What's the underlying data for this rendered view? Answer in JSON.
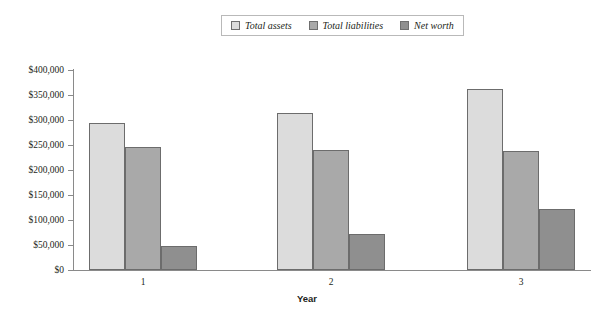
{
  "chart_data": {
    "type": "bar",
    "title": "",
    "subtitle": "",
    "xlabel": "Year",
    "ylabel": "",
    "categories": [
      "1",
      "2",
      "3"
    ],
    "series": [
      {
        "name": "Total assets",
        "values": [
          295000,
          315000,
          363000
        ],
        "color": "#dcdcdc"
      },
      {
        "name": "Total liabilities",
        "values": [
          246000,
          241000,
          239000
        ],
        "color": "#a9a9a9"
      },
      {
        "name": "Net worth",
        "values": [
          49000,
          73000,
          123000
        ],
        "color": "#8f8f8f"
      }
    ],
    "ylim": [
      0,
      400000
    ],
    "ytick_values": [
      0,
      50000,
      100000,
      150000,
      200000,
      250000,
      300000,
      350000,
      400000
    ],
    "ytick_labels": [
      "$0",
      "$50,000",
      "$100,000",
      "$150,000",
      "$200,000",
      "$250,000",
      "$300,000",
      "$350,000",
      "$400,000"
    ],
    "grid": false,
    "legend_position": "top-center",
    "legend_entries": [
      "Total assets",
      "Total liabilities",
      "Net worth"
    ]
  },
  "axis": {
    "x_title": "Year",
    "x_tick_labels": [
      "1",
      "2",
      "3"
    ],
    "y_tick_labels": [
      "$400,000",
      "$350,000",
      "$300,000",
      "$250,000",
      "$200,000",
      "$150,000",
      "$100,000",
      "$50,000",
      "$0"
    ]
  },
  "legend": {
    "items": [
      {
        "label": "Total assets",
        "color": "#dcdcdc"
      },
      {
        "label": "Total liabilities",
        "color": "#a9a9a9"
      },
      {
        "label": "Net worth",
        "color": "#8f8f8f"
      }
    ]
  },
  "colors": {
    "axis": "#8a8a8a",
    "bar_border": "#6c6c6c",
    "text": "#231f20",
    "background": "#ffffff"
  }
}
